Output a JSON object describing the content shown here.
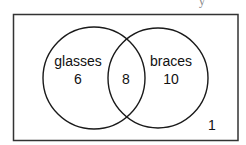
{
  "diagram": {
    "type": "venn",
    "top_fragment": "y",
    "sets": [
      {
        "name": "glasses",
        "only_count": "6"
      },
      {
        "name": "braces",
        "only_count": "10"
      }
    ],
    "intersection_count": "8",
    "outside_count": "1",
    "colors": {
      "stroke": "#1a1a1a",
      "background": "#ffffff",
      "frame": "#333333"
    }
  }
}
